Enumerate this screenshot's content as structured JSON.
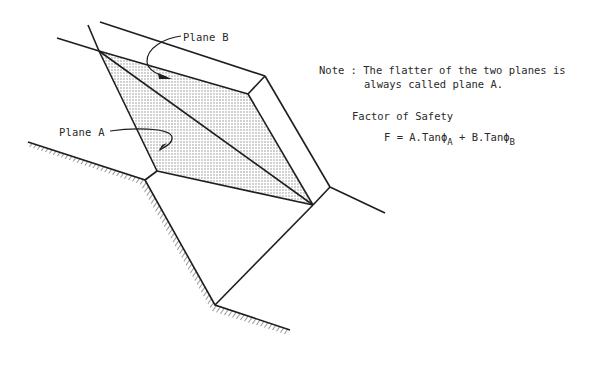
{
  "labels": {
    "plane_b": "Plane B",
    "plane_a": "Plane A"
  },
  "note": {
    "prefix": "Note : ",
    "line1": "The flatter of the two planes is",
    "line2": "always called plane A."
  },
  "factor_of_safety": {
    "title": "Factor of Safety",
    "lhs": "F = ",
    "term_a": "A.Tanϕ",
    "sub_a": "A",
    "plus": " + ",
    "term_b": "B.Tanϕ",
    "sub_b": "B"
  },
  "colors": {
    "line": "#1e1e1e",
    "stipple": "#8a8a8a",
    "background": "#ffffff"
  }
}
